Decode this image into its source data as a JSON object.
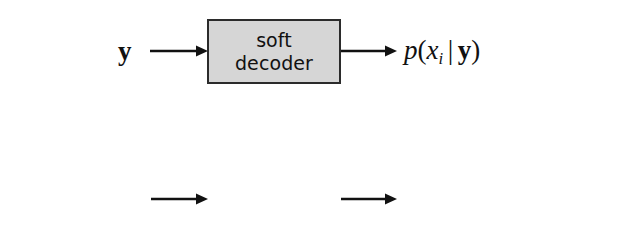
{
  "diagram": {
    "type": "block-diagram",
    "background_color": "#ffffff",
    "box_fill_color": "#d6d6d6",
    "box_border_color": "#2b2b2b",
    "text_color": "#111111",
    "rows": [
      {
        "id": "soft",
        "input_label": "y",
        "box_label_line1": "soft",
        "box_label_line2": "decoder",
        "output_label": "p(x_i | y)"
      },
      {
        "id": "hard",
        "input_label": "p(x_i | y)",
        "box_label_line1": "hard",
        "box_label_line2": "decoder",
        "output_label": "max_{x_i} p(x_i | y)"
      }
    ]
  },
  "labels": {
    "soft_input": {
      "var_bold": "y"
    },
    "soft_box": {
      "line1": "soft",
      "line2": "decoder"
    },
    "soft_output": {
      "p": "p",
      "open": "(",
      "x": "x",
      "sub": "i",
      "mid": "|",
      "y": "y",
      "close": ")"
    },
    "hard_input": {
      "p": "p",
      "open": "(",
      "x": "x",
      "sub": "i",
      "mid": "|",
      "y": "y",
      "close": ")"
    },
    "hard_box": {
      "line1": "hard",
      "line2": "decoder"
    },
    "hard_output": {
      "max": "max",
      "limit_x": "x",
      "limit_sub": "i",
      "p": "p",
      "open": "(",
      "x": "x",
      "sub": "i",
      "mid": "|",
      "y": "y",
      "close": ")"
    }
  },
  "arrows": {
    "soft_in": {
      "name": "arrow-y-to-soft-decoder"
    },
    "soft_out": {
      "name": "arrow-soft-decoder-to-posterior"
    },
    "hard_in": {
      "name": "arrow-posterior-to-hard-decoder"
    },
    "hard_out": {
      "name": "arrow-hard-decoder-to-max"
    }
  }
}
